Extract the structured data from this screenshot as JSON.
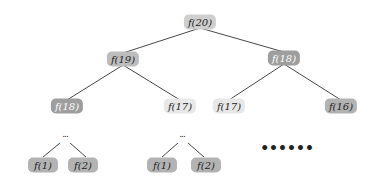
{
  "diagram": {
    "type": "recursion-tree",
    "nodes": [
      {
        "id": "n20",
        "label": "f(20)",
        "x": 200,
        "y": 22,
        "shade": "mid"
      },
      {
        "id": "n19",
        "label": "f(19)",
        "x": 123,
        "y": 59,
        "shade": "med"
      },
      {
        "id": "n18a",
        "label": "f(18)",
        "x": 284,
        "y": 58,
        "shade": "dark"
      },
      {
        "id": "n18b",
        "label": "f(18)",
        "x": 67,
        "y": 106,
        "shade": "dark"
      },
      {
        "id": "n17a",
        "label": "f(17)",
        "x": 180,
        "y": 106,
        "shade": "light"
      },
      {
        "id": "n17b",
        "label": "f(17)",
        "x": 229,
        "y": 106,
        "shade": "light"
      },
      {
        "id": "n16",
        "label": "f(16)",
        "x": 341,
        "y": 106,
        "shade": "medd"
      },
      {
        "id": "n1a",
        "label": "f(1)",
        "x": 43,
        "y": 165,
        "shade": "medd"
      },
      {
        "id": "n2a",
        "label": "f(2)",
        "x": 83,
        "y": 165,
        "shade": "medd"
      },
      {
        "id": "n1b",
        "label": "f(1)",
        "x": 162,
        "y": 165,
        "shade": "medd"
      },
      {
        "id": "n2b",
        "label": "f(2)",
        "x": 206,
        "y": 165,
        "shade": "medd"
      }
    ],
    "ellipses": [
      {
        "label": "...",
        "x": 65,
        "y": 134
      },
      {
        "label": "...",
        "x": 182,
        "y": 134
      }
    ],
    "more_dots": {
      "label": "••••••",
      "x": 287,
      "y": 148
    },
    "edges": [
      [
        "n20",
        "n19"
      ],
      [
        "n20",
        "n18a"
      ],
      [
        "n19",
        "n18b"
      ],
      [
        "n19",
        "n17a"
      ],
      [
        "n18a",
        "n17b"
      ],
      [
        "n18a",
        "n16"
      ]
    ],
    "ellipsis_edges": [
      {
        "from": [
          60,
          143
        ],
        "to": [
          43,
          157
        ]
      },
      {
        "from": [
          70,
          143
        ],
        "to": [
          86,
          157
        ]
      },
      {
        "from": [
          178,
          143
        ],
        "to": [
          162,
          157
        ]
      },
      {
        "from": [
          188,
          143
        ],
        "to": [
          204,
          157
        ]
      }
    ],
    "colors": {
      "light": "#e8e8e8",
      "mid": "#cfcfcf",
      "med": "#bdbdbd",
      "medd": "#b3b3b3",
      "dark": "#9e9e9e",
      "edge": "#333333"
    }
  }
}
